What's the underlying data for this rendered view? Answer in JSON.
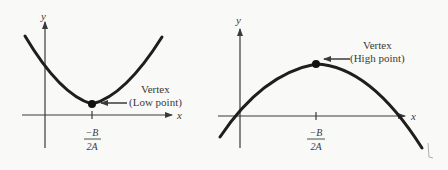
{
  "figure": {
    "left_graph": {
      "axis_x_label": "x",
      "axis_y_label": "y",
      "vertex_label_line1": "Vertex",
      "vertex_label_line2": "(Low point)",
      "tick_label_numerator": "−B",
      "tick_label_denominator": "2A",
      "opens": "up"
    },
    "right_graph": {
      "axis_x_label": "x",
      "axis_y_label": "y",
      "vertex_label_line1": "Vertex",
      "vertex_label_line2": "(High point)",
      "tick_label_numerator": "−B",
      "tick_label_denominator": "2A",
      "opens": "down"
    },
    "colors": {
      "background": "#f9f9f8",
      "curve": "#1e1e1e",
      "axis": "#3a3a3a",
      "text": "#3a3a3a"
    }
  }
}
